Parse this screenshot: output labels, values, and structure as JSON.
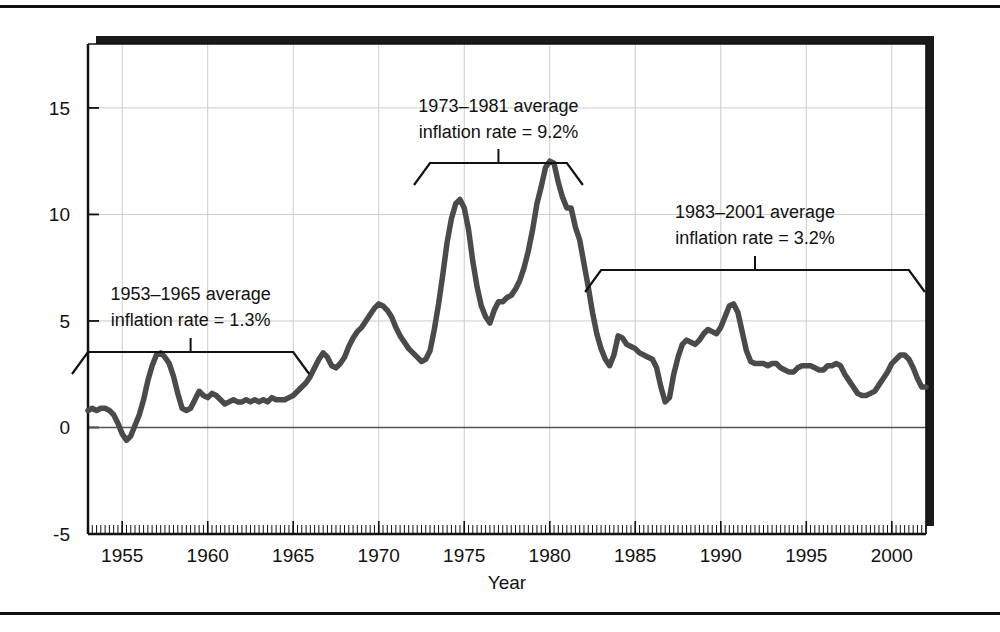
{
  "figure": {
    "background_color": "#ffffff",
    "rule_color": "#111111",
    "plot_shadow_color": "#1a1a1a",
    "plot_border_color": "#111111",
    "grid_color": "#cccccc",
    "line_color": "#4a4a4a",
    "axis_label_color": "#111111"
  },
  "chart_data": {
    "type": "line",
    "title": "",
    "xlabel": "Year",
    "ylabel": "",
    "xlim": [
      1953,
      2002
    ],
    "ylim": [
      -5,
      18
    ],
    "grid": true,
    "legend": "none",
    "x_ticks": [
      "1955",
      "1960",
      "1965",
      "1970",
      "1975",
      "1980",
      "1985",
      "1990",
      "1995",
      "2000"
    ],
    "x_tick_values": [
      1955,
      1960,
      1965,
      1970,
      1975,
      1980,
      1985,
      1990,
      1995,
      2000
    ],
    "y_ticks": [
      "-5",
      "0",
      "5",
      "10",
      "15"
    ],
    "y_tick_values": [
      -5,
      0,
      5,
      10,
      15
    ],
    "minor_x_tick_interval": 0.25,
    "series": [
      {
        "name": "Inflation rate",
        "color": "#4a4a4a",
        "x": [
          1953.0,
          1953.25,
          1953.5,
          1953.75,
          1954.0,
          1954.25,
          1954.5,
          1954.75,
          1955.0,
          1955.25,
          1955.5,
          1955.75,
          1956.0,
          1956.25,
          1956.5,
          1956.75,
          1957.0,
          1957.25,
          1957.5,
          1957.75,
          1958.0,
          1958.25,
          1958.5,
          1958.75,
          1959.0,
          1959.25,
          1959.5,
          1959.75,
          1960.0,
          1960.25,
          1960.5,
          1960.75,
          1961.0,
          1961.25,
          1961.5,
          1961.75,
          1962.0,
          1962.25,
          1962.5,
          1962.75,
          1963.0,
          1963.25,
          1963.5,
          1963.75,
          1964.0,
          1964.25,
          1964.5,
          1964.75,
          1965.0,
          1965.25,
          1965.5,
          1965.75,
          1966.0,
          1966.25,
          1966.5,
          1966.75,
          1967.0,
          1967.25,
          1967.5,
          1967.75,
          1968.0,
          1968.25,
          1968.5,
          1968.75,
          1969.0,
          1969.25,
          1969.5,
          1969.75,
          1970.0,
          1970.25,
          1970.5,
          1970.75,
          1971.0,
          1971.25,
          1971.5,
          1971.75,
          1972.0,
          1972.25,
          1972.5,
          1972.75,
          1973.0,
          1973.25,
          1973.5,
          1973.75,
          1974.0,
          1974.25,
          1974.5,
          1974.75,
          1975.0,
          1975.25,
          1975.5,
          1975.75,
          1976.0,
          1976.25,
          1976.5,
          1976.75,
          1977.0,
          1977.25,
          1977.5,
          1977.75,
          1978.0,
          1978.25,
          1978.5,
          1978.75,
          1979.0,
          1979.25,
          1979.5,
          1979.75,
          1980.0,
          1980.25,
          1980.5,
          1980.75,
          1981.0,
          1981.25,
          1981.5,
          1981.75,
          1982.0,
          1982.25,
          1982.5,
          1982.75,
          1983.0,
          1983.25,
          1983.5,
          1983.75,
          1984.0,
          1984.25,
          1984.5,
          1984.75,
          1985.0,
          1985.25,
          1985.5,
          1985.75,
          1986.0,
          1986.25,
          1986.5,
          1986.75,
          1987.0,
          1987.25,
          1987.5,
          1987.75,
          1988.0,
          1988.25,
          1988.5,
          1988.75,
          1989.0,
          1989.25,
          1989.5,
          1989.75,
          1990.0,
          1990.25,
          1990.5,
          1990.75,
          1991.0,
          1991.25,
          1991.5,
          1991.75,
          1992.0,
          1992.25,
          1992.5,
          1992.75,
          1993.0,
          1993.25,
          1993.5,
          1993.75,
          1994.0,
          1994.25,
          1994.5,
          1994.75,
          1995.0,
          1995.25,
          1995.5,
          1995.75,
          1996.0,
          1996.25,
          1996.5,
          1996.75,
          1997.0,
          1997.25,
          1997.5,
          1997.75,
          1998.0,
          1998.25,
          1998.5,
          1998.75,
          1999.0,
          1999.25,
          1999.5,
          1999.75,
          2000.0,
          2000.25,
          2000.5,
          2000.75,
          2001.0,
          2001.25,
          2001.5,
          2001.75,
          2002.0
        ],
        "y": [
          0.8,
          0.9,
          0.8,
          0.9,
          0.9,
          0.8,
          0.6,
          0.2,
          -0.3,
          -0.6,
          -0.4,
          0.1,
          0.6,
          1.3,
          2.2,
          2.9,
          3.4,
          3.5,
          3.3,
          3.0,
          2.4,
          1.6,
          0.9,
          0.8,
          0.9,
          1.3,
          1.7,
          1.5,
          1.4,
          1.6,
          1.5,
          1.3,
          1.1,
          1.2,
          1.3,
          1.2,
          1.2,
          1.3,
          1.2,
          1.3,
          1.2,
          1.3,
          1.2,
          1.4,
          1.3,
          1.3,
          1.3,
          1.4,
          1.5,
          1.7,
          1.9,
          2.1,
          2.4,
          2.8,
          3.2,
          3.5,
          3.3,
          2.9,
          2.8,
          3.0,
          3.3,
          3.8,
          4.2,
          4.5,
          4.7,
          5.0,
          5.3,
          5.6,
          5.8,
          5.7,
          5.5,
          5.2,
          4.7,
          4.3,
          4.0,
          3.7,
          3.5,
          3.3,
          3.1,
          3.2,
          3.6,
          4.6,
          5.8,
          7.2,
          8.7,
          9.8,
          10.5,
          10.7,
          10.3,
          9.3,
          7.8,
          6.6,
          5.7,
          5.2,
          4.9,
          5.5,
          5.9,
          5.9,
          6.1,
          6.2,
          6.5,
          6.9,
          7.5,
          8.3,
          9.3,
          10.5,
          11.3,
          12.2,
          12.5,
          12.4,
          11.5,
          10.8,
          10.3,
          10.3,
          9.4,
          8.8,
          7.7,
          6.6,
          5.4,
          4.4,
          3.7,
          3.2,
          2.9,
          3.4,
          4.3,
          4.2,
          3.9,
          3.8,
          3.7,
          3.5,
          3.4,
          3.3,
          3.2,
          2.8,
          1.9,
          1.2,
          1.4,
          2.5,
          3.3,
          3.9,
          4.1,
          4.0,
          3.9,
          4.1,
          4.4,
          4.6,
          4.5,
          4.4,
          4.7,
          5.2,
          5.7,
          5.8,
          5.4,
          4.5,
          3.6,
          3.1,
          3.0,
          3.0,
          3.0,
          2.9,
          3.0,
          3.0,
          2.8,
          2.7,
          2.6,
          2.6,
          2.8,
          2.9,
          2.9,
          2.9,
          2.8,
          2.7,
          2.7,
          2.9,
          2.9,
          3.0,
          2.9,
          2.5,
          2.2,
          1.9,
          1.6,
          1.5,
          1.5,
          1.6,
          1.7,
          2.0,
          2.3,
          2.6,
          3.0,
          3.2,
          3.4,
          3.4,
          3.2,
          2.8,
          2.3,
          1.9,
          1.9
        ]
      }
    ],
    "annotations": [
      {
        "id": "annot-1953-1965",
        "line1": "1953–1965 average",
        "line2": "inflation rate = 1.3%",
        "bracket_start_year": 1953,
        "bracket_end_year": 1965,
        "value": 1.3
      },
      {
        "id": "annot-1973-1981",
        "line1": "1973–1981 average",
        "line2": "inflation rate = 9.2%",
        "bracket_start_year": 1973,
        "bracket_end_year": 1981,
        "value": 9.2
      },
      {
        "id": "annot-1983-2001",
        "line1": "1983–2001 average",
        "line2": "inflation rate = 3.2%",
        "bracket_start_year": 1983,
        "bracket_end_year": 2001,
        "value": 3.2
      }
    ]
  }
}
